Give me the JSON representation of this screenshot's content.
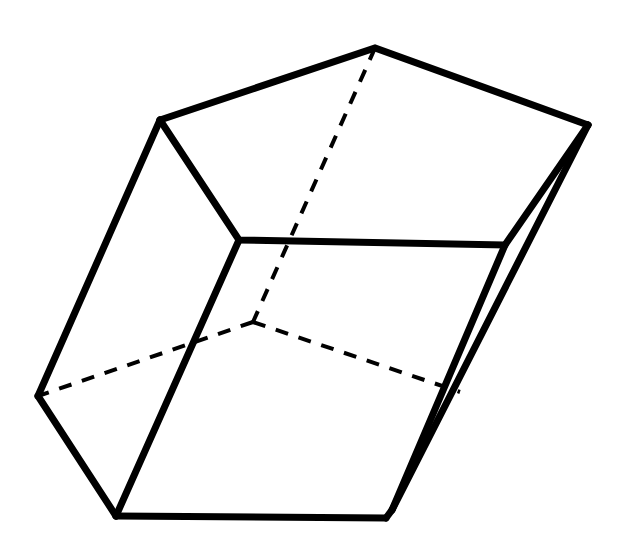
{
  "figure": {
    "canvas": {
      "width": 621,
      "height": 544
    },
    "background_color": "#ffffff",
    "line_color": "#000000",
    "solid_stroke_width": 7,
    "hidden_stroke_width": 4,
    "hidden_dash_pattern": "13 11",
    "thin_stroke_width": 5
  },
  "chart_data": {
    "type": "diagram",
    "vertices": {
      "top_apex": [
        375,
        48
      ],
      "top_left": [
        160,
        120
      ],
      "top_right": [
        588,
        125
      ],
      "mid_left": [
        239,
        240
      ],
      "mid_right": [
        505,
        245
      ],
      "far_left": [
        38,
        396
      ],
      "bottom_left": [
        116,
        516
      ],
      "bottom_right": [
        386,
        518
      ],
      "right_spur": [
        392,
        510
      ],
      "right_edge_cross": [
        460,
        392
      ],
      "hidden_center": [
        253,
        322
      ]
    },
    "solid_edges": [
      [
        "top_left",
        "top_apex"
      ],
      [
        "top_apex",
        "top_right"
      ],
      [
        "top_left",
        "mid_left"
      ],
      [
        "mid_left",
        "mid_right"
      ],
      [
        "mid_right",
        "top_right"
      ],
      [
        "top_left",
        "far_left"
      ],
      [
        "far_left",
        "bottom_left"
      ],
      [
        "mid_left",
        "bottom_left"
      ],
      [
        "bottom_left",
        "bottom_right"
      ],
      [
        "bottom_right",
        "right_spur"
      ],
      [
        "right_spur",
        "top_right"
      ],
      [
        "mid_right",
        "right_spur"
      ]
    ],
    "hidden_edges": [
      [
        "top_apex",
        "hidden_center"
      ],
      [
        "hidden_center",
        "far_left"
      ],
      [
        "hidden_center",
        "right_edge_cross"
      ]
    ]
  }
}
